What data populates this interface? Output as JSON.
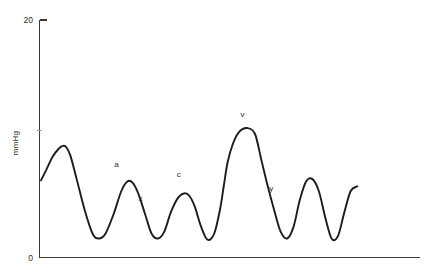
{
  "figure": {
    "background_color": "#ffffff",
    "trace_color": "#1c1c1c",
    "axis_color": "#3a3a3a"
  },
  "chart_data": {
    "type": "line",
    "title": "",
    "subtitle": "",
    "xlabel": "",
    "ylabel": "mmHg",
    "xlim": [
      0,
      100
    ],
    "ylim": [
      0,
      20
    ],
    "grid": false,
    "legend": "none",
    "y_ticks": [
      {
        "value": 20,
        "label": "20"
      },
      {
        "value": 10,
        "label": ""
      },
      {
        "value": 0,
        "label": "0"
      }
    ],
    "x_ticks": [],
    "series": [
      {
        "name": "jugular-venous-pressure",
        "x": [
          0.3,
          2.0,
          4.0,
          6.0,
          7.2,
          8.2,
          9.5,
          11.5,
          14.0,
          16.5,
          18.4,
          20.5,
          23.0,
          25.5,
          27.4,
          29.0,
          30.8,
          33.0,
          35.0,
          37.0,
          39.0,
          41.0,
          43.2,
          45.2,
          46.8,
          48.5,
          50.5,
          52.5,
          54.6,
          56.4,
          57.6,
          58.8,
          60.5,
          62.5,
          65.0,
          67.4,
          69.4,
          71.4,
          73.4,
          75.4,
          77.5,
          79.5,
          81.4,
          83.4,
          85.4,
          87.4,
          89.4,
          91.4,
          93.4,
          95.4,
          97.4,
          99.5
        ],
        "y": [
          6.5,
          7.4,
          8.5,
          9.2,
          9.4,
          9.3,
          8.6,
          6.6,
          4.0,
          2.0,
          1.6,
          2.0,
          3.6,
          5.6,
          6.4,
          6.3,
          5.4,
          3.6,
          2.0,
          1.6,
          2.2,
          3.8,
          5.0,
          5.4,
          5.2,
          4.3,
          2.6,
          1.5,
          2.0,
          4.0,
          6.0,
          8.0,
          9.6,
          10.6,
          10.9,
          10.4,
          8.2,
          6.0,
          4.0,
          2.2,
          1.6,
          2.6,
          4.8,
          6.4,
          6.6,
          5.6,
          3.4,
          1.6,
          1.8,
          3.8,
          5.6,
          6.0
        ]
      }
    ],
    "annotations": [
      {
        "label": "a",
        "x": 24.0,
        "y": 7.6,
        "description": "a-wave peak, atrial contraction"
      },
      {
        "label": "x",
        "x": 31.5,
        "y": 4.8,
        "description": "x-descent, atrial relaxation"
      },
      {
        "label": "c",
        "x": 43.5,
        "y": 6.8,
        "description": "c-wave, tricuspid bulging"
      },
      {
        "label": "v",
        "x": 63.5,
        "y": 11.8,
        "description": "v-wave peak, atrial filling"
      },
      {
        "label": "y",
        "x": 72.5,
        "y": 5.6,
        "description": "y-descent, tricuspid opening"
      }
    ]
  }
}
